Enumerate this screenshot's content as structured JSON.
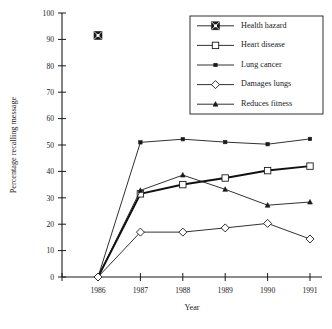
{
  "chart_data": {
    "type": "line",
    "title": "",
    "xlabel": "Year",
    "ylabel": "Percentage recalling message",
    "categories": [
      "1986",
      "1987",
      "1988",
      "1989",
      "1990",
      "1991"
    ],
    "x": [
      1986,
      1987,
      1988,
      1989,
      1990,
      1991
    ],
    "xlim": [
      1985.4,
      1991.6
    ],
    "ylim": [
      0,
      100
    ],
    "yticks": [
      0,
      10,
      20,
      30,
      40,
      50,
      60,
      70,
      80,
      90,
      100
    ],
    "ytick_labels": [
      "0",
      "10",
      "20",
      "30",
      "40",
      "50",
      "60",
      "70",
      "80",
      "90",
      "100"
    ],
    "xtick_labels": [
      "1986",
      "1987",
      "1988",
      "1989",
      "1990",
      "1991"
    ],
    "grid": false,
    "legend_position": "top-right",
    "series": [
      {
        "name": "Health hazard",
        "marker": "square-crossed",
        "values": [
          91.5,
          null,
          null,
          null,
          null,
          null
        ]
      },
      {
        "name": "Heart disease",
        "marker": "open-square",
        "values": [
          0,
          31.5,
          35,
          37.5,
          40.3,
          42
        ]
      },
      {
        "name": "Lung cancer",
        "marker": "small-filled-square",
        "values": [
          0,
          51,
          52.2,
          51.1,
          50.3,
          52.3
        ]
      },
      {
        "name": "Damages lungs",
        "marker": "open-diamond",
        "values": [
          0,
          17,
          17,
          18.6,
          20.3,
          14.4
        ]
      },
      {
        "name": "Reduces fitness",
        "marker": "small-filled-triangle",
        "values": [
          0,
          32.8,
          38.6,
          33.2,
          27.2,
          28.4
        ]
      }
    ]
  },
  "legend": {
    "entries": [
      {
        "label": "Health hazard"
      },
      {
        "label": "Heart disease"
      },
      {
        "label": "Lung cancer"
      },
      {
        "label": "Damages lungs"
      },
      {
        "label": "Reduces fitness"
      }
    ]
  },
  "colors": {
    "ink": "#1a1a1a",
    "background": "#ffffff"
  }
}
